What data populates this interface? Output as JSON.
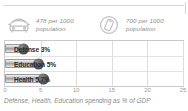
{
  "stats": [
    {
      "icon": "car-icon",
      "value": "478 per 1000",
      "unit": "population",
      "text": "478 per 1000 population"
    },
    {
      "icon": "mobile-phone-circle-icon",
      "value": "700 per 1000",
      "unit": "population",
      "text": "700 per 1000 population"
    }
  ],
  "caption": "Defense, Health, Education spending as % of GDP",
  "colors": {
    "bar_fill": "#9e9e9e",
    "bar_border": "#9a9a9a",
    "knob": "#3a3a3a",
    "grid": "#dcdcdc",
    "frame": "#c9c9c9",
    "muted_text": "#8d8d8d",
    "label_text": "#2a2a2a"
  },
  "chart_data": {
    "type": "bar",
    "orientation": "horizontal",
    "title": "",
    "subtitle": "",
    "xlabel": "",
    "ylabel": "",
    "caption": "Defense, Health, Education spending as % of GDP",
    "categories": [
      "Defense",
      "Education",
      "Health"
    ],
    "values": [
      3,
      5,
      5.7
    ],
    "data_labels": [
      "Defense 3%",
      "Education 5%",
      "Health 5.7%"
    ],
    "units": "% of GDP",
    "xlim": [
      0,
      25
    ],
    "xticks": [
      0,
      5,
      10,
      15,
      20,
      25
    ],
    "xtick_labels": [
      "0",
      "5",
      "10",
      "15",
      "20",
      "25"
    ],
    "grid": true,
    "legend": false,
    "legend_position": "none"
  }
}
